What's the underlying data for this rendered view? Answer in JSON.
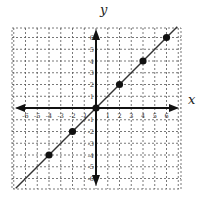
{
  "chart_data": {
    "type": "scatter",
    "title": "",
    "xlabel": "x",
    "ylabel": "y",
    "xlim": [
      -6,
      6
    ],
    "ylim": [
      -6,
      6
    ],
    "grid": true,
    "grid_style": "dashed",
    "x_ticks": [
      -6,
      -5,
      -4,
      -3,
      -2,
      -1,
      1,
      2,
      3,
      4,
      5,
      6
    ],
    "y_ticks": [
      -6,
      -5,
      -4,
      -3,
      -2,
      -1,
      1,
      2,
      3,
      4,
      5,
      6
    ],
    "series": [
      {
        "name": "points",
        "x": [
          -4,
          -2,
          0,
          2,
          4,
          6
        ],
        "y": [
          -4,
          -2,
          0,
          2,
          4,
          6
        ]
      }
    ],
    "line": {
      "equation": "y = x",
      "from": [
        -7,
        -7
      ],
      "to": [
        7,
        7
      ]
    }
  },
  "colors": {
    "grid": "#555555",
    "axis": "#111111",
    "line": "#333333",
    "point": "#111111"
  }
}
